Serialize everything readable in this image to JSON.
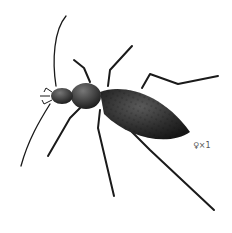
{
  "image": {
    "subject": "beetle illustration",
    "description": "Black ground beetle, dorsal view, head pointing upper-left",
    "annotation": "♀×1"
  },
  "colors": {
    "background": "#ffffff",
    "body": "#2a2a2a",
    "highlight": "#6a6a6a",
    "label": "#555555"
  }
}
